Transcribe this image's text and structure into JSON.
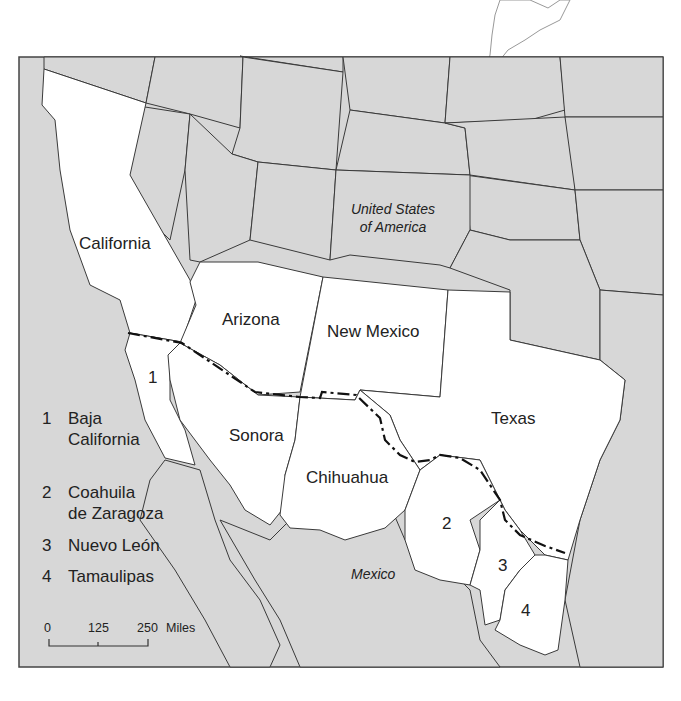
{
  "map": {
    "labels": {
      "usa": [
        "United States",
        "of America"
      ],
      "mexico": "Mexico",
      "california": "California",
      "arizona": "Arizona",
      "new_mexico": "New Mexico",
      "texas": "Texas",
      "sonora": "Sonora",
      "chihuahua": "Chihuahua",
      "region_1": "1",
      "region_2": "2",
      "region_3": "3",
      "region_4": "4"
    },
    "highlighted_regions": [
      "California",
      "Arizona",
      "New Mexico",
      "Texas",
      "Baja California",
      "Sonora",
      "Chihuahua",
      "Coahuila de Zaragoza",
      "Nuevo León",
      "Tamaulipas"
    ],
    "colors": {
      "highlight": "#ffffff",
      "background_land": "#d7d7d7",
      "border_line": "#111111"
    }
  },
  "legend": {
    "items": [
      {
        "num": "1",
        "lines": [
          "Baja",
          "California"
        ]
      },
      {
        "num": "2",
        "lines": [
          "Coahuila",
          "de Zaragoza"
        ]
      },
      {
        "num": "3",
        "lines": [
          "Nuevo León"
        ]
      },
      {
        "num": "4",
        "lines": [
          "Tamaulipas"
        ]
      }
    ]
  },
  "scale_bar": {
    "ticks": [
      "0",
      "125",
      "250"
    ],
    "unit": "Miles"
  }
}
